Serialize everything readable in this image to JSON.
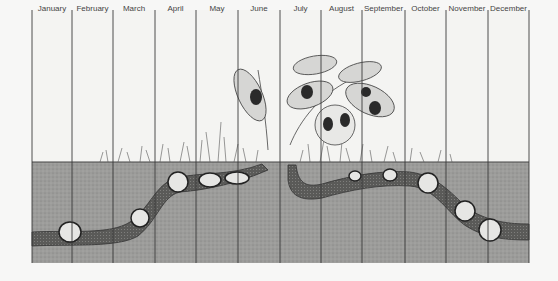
{
  "figure": {
    "type": "life-cycle-calendar",
    "months": [
      "January",
      "February",
      "March",
      "April",
      "May",
      "June",
      "July",
      "August",
      "September",
      "October",
      "November",
      "December"
    ]
  },
  "colors": {
    "background": "#f7f7f6",
    "sky": "#f4f4f2",
    "soil": "#9a9a98",
    "tunnel": "#5e5e5c",
    "lines": "#3a3a3a",
    "grub_fill": "#e8e8e6",
    "beetle": "#2a2a2a",
    "foliage": "#d8d8d6"
  },
  "layout": {
    "column_edges": [
      32,
      72,
      113,
      155,
      196,
      238,
      280,
      321,
      362,
      405,
      446,
      488,
      529
    ],
    "ground_y": 162,
    "soil_bottom_y": 263
  }
}
